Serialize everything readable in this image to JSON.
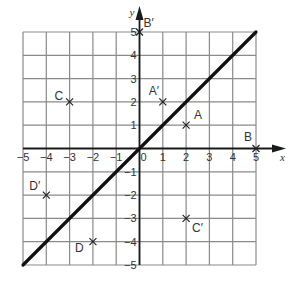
{
  "diagram": {
    "type": "coordinate-grid-reflection",
    "x_axis_label": "x",
    "y_axis_label": "y",
    "x_range": [
      -5,
      5
    ],
    "y_range": [
      -5,
      5
    ],
    "x_ticks": [
      "-5",
      "-4",
      "-3",
      "-2",
      "-1",
      "0",
      "1",
      "2",
      "3",
      "4",
      "5"
    ],
    "y_ticks": [
      "5",
      "4",
      "3",
      "2",
      "1",
      "-1",
      "-2",
      "-3",
      "-4",
      "-5"
    ],
    "mirror_line": {
      "equation": "y = x",
      "from": [
        -5,
        -5
      ],
      "to": [
        5,
        5
      ]
    },
    "points": [
      {
        "label": "A",
        "x": 2,
        "y": 1
      },
      {
        "label": "A′",
        "x": 1,
        "y": 2
      },
      {
        "label": "B",
        "x": 5,
        "y": 0
      },
      {
        "label": "B′",
        "x": 0,
        "y": 5
      },
      {
        "label": "C",
        "x": -3,
        "y": 2
      },
      {
        "label": "C′",
        "x": 2,
        "y": -3
      },
      {
        "label": "D",
        "x": -2,
        "y": -4
      },
      {
        "label": "D′",
        "x": -4,
        "y": -2
      }
    ],
    "colors": {
      "grid": "#8a8a8a",
      "axis": "#1a1a1a",
      "line": "#111111",
      "text": "#333333"
    }
  }
}
